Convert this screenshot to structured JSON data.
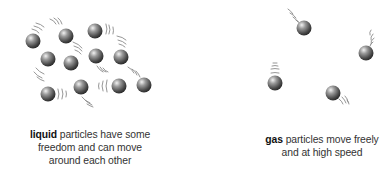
{
  "diagram": {
    "panels": [
      {
        "id": "liquid",
        "keyword": "liquid",
        "caption_lines": [
          "particles have some",
          "freedom and can move",
          "around each other"
        ],
        "particles": [
          {
            "x": 33,
            "y": 41
          },
          {
            "x": 66,
            "y": 36
          },
          {
            "x": 95,
            "y": 31
          },
          {
            "x": 48,
            "y": 59
          },
          {
            "x": 71,
            "y": 63
          },
          {
            "x": 96,
            "y": 56
          },
          {
            "x": 121,
            "y": 57
          },
          {
            "x": 48,
            "y": 94
          },
          {
            "x": 81,
            "y": 87
          },
          {
            "x": 119,
            "y": 86
          },
          {
            "x": 144,
            "y": 85
          }
        ]
      },
      {
        "id": "gas",
        "keyword": "gas",
        "caption_lines": [
          "particles move freely",
          "and at high speed"
        ],
        "particles": [
          {
            "x": 304,
            "y": 28
          },
          {
            "x": 366,
            "y": 53
          },
          {
            "x": 275,
            "y": 83
          },
          {
            "x": 333,
            "y": 93
          }
        ]
      }
    ],
    "colors": {
      "particle_light": "#e6e6e6",
      "particle_dark": "#3a3a3a",
      "motion_lines": "#8a8a8a",
      "text": "#333333"
    }
  }
}
